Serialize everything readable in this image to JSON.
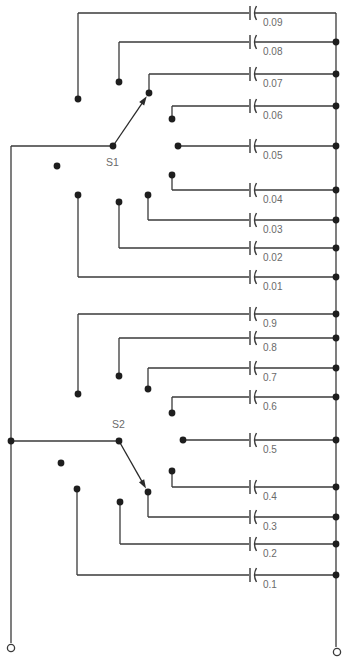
{
  "diagram": {
    "colors": {
      "wire": "#3a3a3a",
      "dot": "#1e1e1e",
      "label": "#6a6a6a",
      "background": "#ffffff"
    },
    "left_bus": {
      "x": 11,
      "y_top": 146,
      "y_bottom": 643
    },
    "right_bus": {
      "x": 336,
      "y_top": 13,
      "y_bottom": 647
    },
    "terminals": [
      {
        "name": "left-terminal",
        "x": 11,
        "y": 648
      },
      {
        "name": "right-terminal",
        "x": 337,
        "y": 652
      }
    ],
    "capacitor_x": 250,
    "switches": [
      {
        "label": "S1",
        "decade": "0.01 – 0.09",
        "pivot": {
          "x": 113,
          "y": 146
        },
        "label_pos": {
          "x": 106,
          "y": 166
        },
        "off_contact": {
          "x": 57,
          "y": 166
        },
        "selected": "0.07",
        "bus_junction": false,
        "contacts": [
          {
            "value": "0.09",
            "cx": 78,
            "cy": 99,
            "row_y": 13,
            "bus_dot": false
          },
          {
            "value": "0.08",
            "cx": 119,
            "cy": 82,
            "row_y": 42,
            "bus_dot": true
          },
          {
            "value": "0.07",
            "cx": 149,
            "cy": 93,
            "row_y": 74,
            "bus_dot": true
          },
          {
            "value": "0.06",
            "cx": 172,
            "cy": 119,
            "row_y": 106,
            "bus_dot": true
          },
          {
            "value": "0.05",
            "cx": 178,
            "cy": 146,
            "row_y": 146,
            "bus_dot": true
          },
          {
            "value": "0.04",
            "cx": 172,
            "cy": 175,
            "row_y": 190,
            "bus_dot": true
          },
          {
            "value": "0.03",
            "cx": 148,
            "cy": 195,
            "row_y": 220,
            "bus_dot": true
          },
          {
            "value": "0.02",
            "cx": 119,
            "cy": 202,
            "row_y": 248,
            "bus_dot": true
          },
          {
            "value": "0.01",
            "cx": 78,
            "cy": 195,
            "row_y": 277,
            "bus_dot": true
          }
        ]
      },
      {
        "label": "S2",
        "decade": "0.1 – 0.9",
        "pivot": {
          "x": 119,
          "y": 441
        },
        "label_pos": {
          "x": 112,
          "y": 428
        },
        "off_contact": {
          "x": 61,
          "y": 463
        },
        "selected": "0.3",
        "bus_junction": true,
        "contacts": [
          {
            "value": "0.9",
            "cx": 78,
            "cy": 394,
            "row_y": 314,
            "bus_dot": true
          },
          {
            "value": "0.8",
            "cx": 119,
            "cy": 376,
            "row_y": 338,
            "bus_dot": true
          },
          {
            "value": "0.7",
            "cx": 148,
            "cy": 389,
            "row_y": 368,
            "bus_dot": true
          },
          {
            "value": "0.6",
            "cx": 172,
            "cy": 413,
            "row_y": 397,
            "bus_dot": true
          },
          {
            "value": "0.5",
            "cx": 183,
            "cy": 440,
            "row_y": 440,
            "bus_dot": true
          },
          {
            "value": "0.4",
            "cx": 172,
            "cy": 471,
            "row_y": 487,
            "bus_dot": true
          },
          {
            "value": "0.3",
            "cx": 148,
            "cy": 492,
            "row_y": 517,
            "bus_dot": true
          },
          {
            "value": "0.2",
            "cx": 120,
            "cy": 502,
            "row_y": 544,
            "bus_dot": true
          },
          {
            "value": "0.1",
            "cx": 77,
            "cy": 489,
            "row_y": 575,
            "bus_dot": true
          }
        ]
      }
    ]
  }
}
